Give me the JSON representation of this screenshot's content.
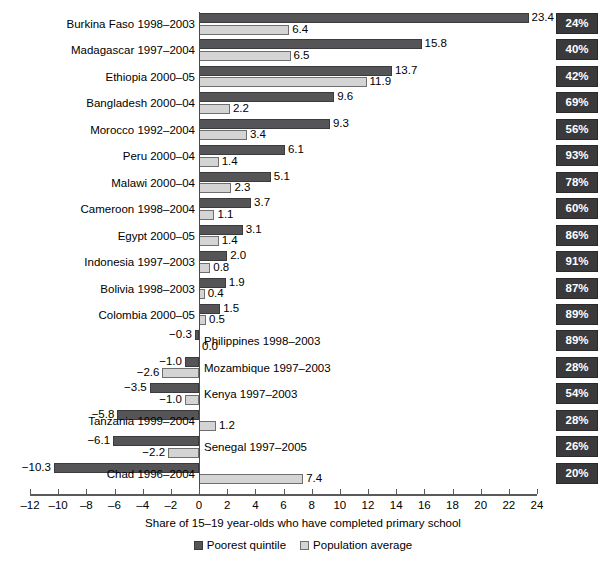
{
  "chart_data": {
    "type": "bar",
    "orientation": "horizontal",
    "title": "",
    "xlabel": "Share of 15–19 year-olds who have completed primary school",
    "ylabel": "",
    "xlim": [
      -12,
      24
    ],
    "xticks": [
      -12,
      -10,
      -8,
      -6,
      -4,
      -2,
      0,
      2,
      4,
      6,
      8,
      10,
      12,
      14,
      16,
      18,
      20,
      22,
      24
    ],
    "xtick_labels": [
      "–12",
      "–10",
      "–8",
      "–6",
      "–4",
      "–2",
      "0",
      "2",
      "4",
      "6",
      "8",
      "10",
      "12",
      "14",
      "16",
      "18",
      "20",
      "22",
      "24"
    ],
    "grid": false,
    "legend_position": "bottom-center",
    "categories": [
      "Burkina Faso 1998–2003",
      "Madagascar 1997–2004",
      "Ethiopia 2000–05",
      "Bangladesh 2000–04",
      "Morocco 1992–2004",
      "Peru 2000–04",
      "Malawi 2000–04",
      "Cameroon 1998–2004",
      "Egypt 2000–05",
      "Indonesia 1997–2003",
      "Bolivia 1998–2003",
      "Colombia 2000–05",
      "Philippines 1998–2003",
      "Mozambique 1997–2003",
      "Kenya 1997–2003",
      "Tanzania 1999–2004",
      "Senegal 1997–2005",
      "Chad 1996–2004"
    ],
    "series": [
      {
        "name": "Poorest quintile",
        "color": "#555558",
        "values": [
          23.4,
          15.8,
          13.7,
          9.6,
          9.3,
          6.1,
          5.1,
          3.7,
          3.1,
          2.0,
          1.9,
          1.5,
          -0.3,
          -1.0,
          -3.5,
          -5.8,
          -6.1,
          -10.3
        ],
        "labels": [
          "23.4",
          "15.8",
          "13.7",
          "9.6",
          "9.3",
          "6.1",
          "5.1",
          "3.7",
          "3.1",
          "2.0",
          "1.9",
          "1.5",
          "−0.3",
          "−1.0",
          "−3.5",
          "−5.8",
          "−6.1",
          "−10.3"
        ]
      },
      {
        "name": "Population average",
        "color": "#d4d4d4",
        "values": [
          6.4,
          6.5,
          11.9,
          2.2,
          3.4,
          1.4,
          2.3,
          1.1,
          1.4,
          0.8,
          0.4,
          0.5,
          0.0,
          -2.6,
          -1.0,
          1.2,
          -2.2,
          7.4
        ],
        "labels": [
          "6.4",
          "6.5",
          "11.9",
          "2.2",
          "3.4",
          "1.4",
          "2.3",
          "1.1",
          "1.4",
          "0.8",
          "0.4",
          "0.5",
          "0.0",
          "−2.6",
          "−1.0",
          "1.2",
          "−2.2",
          "7.4"
        ]
      }
    ],
    "annotations": {
      "name": "percent-column",
      "values": [
        "24%",
        "40%",
        "42%",
        "69%",
        "56%",
        "93%",
        "78%",
        "60%",
        "86%",
        "91%",
        "87%",
        "89%",
        "89%",
        "28%",
        "54%",
        "28%",
        "26%",
        "20%"
      ]
    },
    "label_side": [
      "left",
      "left",
      "left",
      "left",
      "left",
      "left",
      "left",
      "left",
      "left",
      "left",
      "left",
      "left",
      "right",
      "right",
      "right",
      "left",
      "right",
      "left"
    ]
  },
  "legend": {
    "items": [
      {
        "label": "Poorest quintile",
        "swatch": "dark"
      },
      {
        "label": "Population average",
        "swatch": "light"
      }
    ]
  },
  "axis": {
    "title": "Share of 15–19 year-olds who have completed primary school"
  },
  "colors": {
    "dark_bar": "#555558",
    "light_bar": "#d4d4d4",
    "pct_box": "#3a3a3d",
    "pct_text": "#ffffff",
    "axis": "#5a5a5a",
    "background": "#ffffff"
  }
}
